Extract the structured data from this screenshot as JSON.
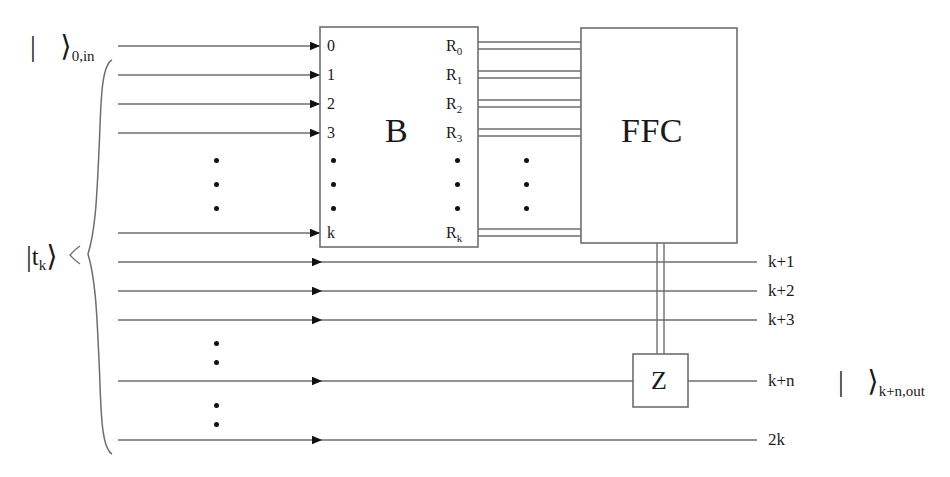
{
  "figure": {
    "kind": "quantum-circuit-diagram",
    "background": "#ffffff",
    "line_color": "#6e6e6e",
    "ink_color": "#1a1a1a"
  },
  "labels": {
    "input_ket": {
      "bar": "|",
      "angle": "⟩",
      "subscript": "0,in"
    },
    "target_ket": {
      "bar": "|",
      "symbol": "t",
      "symbol_sub": "k",
      "angle": "⟩"
    },
    "output_ket": {
      "bar": "|",
      "angle": "⟩",
      "subscript": "k+n,out"
    }
  },
  "boxes": {
    "b": {
      "title": "B",
      "inputs": [
        "0",
        "1",
        "2",
        "3",
        "k"
      ],
      "outputs": [
        {
          "base": "R",
          "sub": "0"
        },
        {
          "base": "R",
          "sub": "1"
        },
        {
          "base": "R",
          "sub": "2"
        },
        {
          "base": "R",
          "sub": "3"
        },
        {
          "base": "R",
          "sub": "k"
        }
      ]
    },
    "ffc": {
      "title": "FFC"
    },
    "z": {
      "title": "Z"
    }
  },
  "wire_labels": {
    "right": [
      "k+1",
      "k+2",
      "k+3",
      "k+n",
      "2k"
    ]
  },
  "ellipses": {
    "left_column": 3,
    "b_input_column": 3,
    "b_output_column": 3,
    "bus_column": 3,
    "lower_first": 2,
    "lower_second": 2
  }
}
